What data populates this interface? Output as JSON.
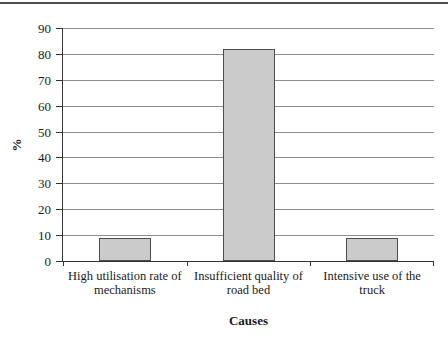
{
  "chart_data": {
    "type": "bar",
    "categories": [
      "High utilisation rate of mechanisms",
      "Insufficient quality of road bed",
      "Intensive use of the truck"
    ],
    "category_lines": [
      [
        "High utilisation rate of",
        "mechanisms"
      ],
      [
        "Insufficient quality of",
        "road bed"
      ],
      [
        "Intensive use of the",
        "truck"
      ]
    ],
    "values": [
      9,
      82,
      9
    ],
    "xlabel": "Causes",
    "ylabel": "%",
    "ylim": [
      0,
      90
    ],
    "yticks": [
      0,
      10,
      20,
      30,
      40,
      50,
      60,
      70,
      80,
      90
    ],
    "grid": true,
    "legend": "none",
    "colors": {
      "bar_fill": "#cbcbcb",
      "bar_border": "#4d4d4d",
      "gridline": "#8c8c8c",
      "axis": "#333333",
      "text": "#1b1b1b",
      "top_rule": "#4e4e4e"
    }
  }
}
